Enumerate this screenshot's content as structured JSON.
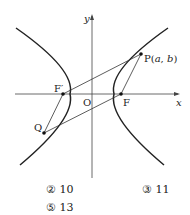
{
  "diagram": {
    "axes": {
      "x_label": "x",
      "y_label": "y",
      "origin_label": "O"
    },
    "points": {
      "P": {
        "label_prefix": "P(",
        "a": "a",
        "sep": ", ",
        "b": "b",
        "suffix": ")"
      },
      "F": {
        "label": "F"
      },
      "F_prime": {
        "label": "F′"
      },
      "Q": {
        "label": "Q"
      }
    }
  },
  "choices": [
    {
      "label": "② 10"
    },
    {
      "label": "③ 11"
    },
    {
      "label": "⑤ 13"
    }
  ]
}
